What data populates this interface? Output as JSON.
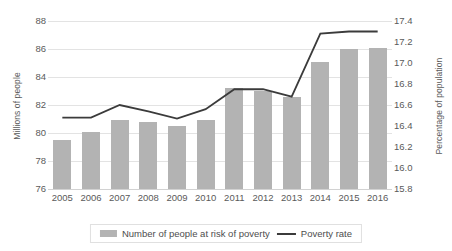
{
  "chart_data": {
    "type": "bar",
    "title": "",
    "xlabel": "",
    "categories": [
      "2005",
      "2006",
      "2007",
      "2008",
      "2009",
      "2010",
      "2011",
      "2012",
      "2013",
      "2014",
      "2015",
      "2016"
    ],
    "grid": true,
    "legend_position": "bottom",
    "series": [
      {
        "name": "Number of people at risk of poverty",
        "type": "bar",
        "axis": "left",
        "color": "#b3b3b3",
        "values": [
          79.5,
          80.1,
          80.9,
          80.8,
          80.5,
          80.9,
          83.2,
          83.0,
          82.6,
          85.1,
          86.0,
          86.1
        ]
      },
      {
        "name": "Poverty rate",
        "type": "line",
        "axis": "right",
        "color": "#3b3b3b",
        "values": [
          16.48,
          16.48,
          16.6,
          16.54,
          16.47,
          16.56,
          16.75,
          16.75,
          16.68,
          17.28,
          17.3,
          17.3
        ]
      }
    ],
    "y_left": {
      "label": "Millions of people",
      "ticks": [
        "88",
        "86",
        "84",
        "82",
        "80",
        "78",
        "76"
      ],
      "ylim": [
        76,
        88
      ]
    },
    "y_right": {
      "label": "Percentage of population",
      "ticks": [
        "17.4",
        "17.2",
        "17.0",
        "16.8",
        "16.6",
        "16.4",
        "16.2",
        "16.0",
        "15.8"
      ],
      "ylim": [
        15.8,
        17.4
      ]
    },
    "legend": [
      {
        "label": "Number of people at risk of poverty",
        "marker": "bar-swatch",
        "color": "#b3b3b3"
      },
      {
        "label": "Poverty rate",
        "marker": "line-swatch",
        "color": "#3b3b3b"
      }
    ]
  }
}
